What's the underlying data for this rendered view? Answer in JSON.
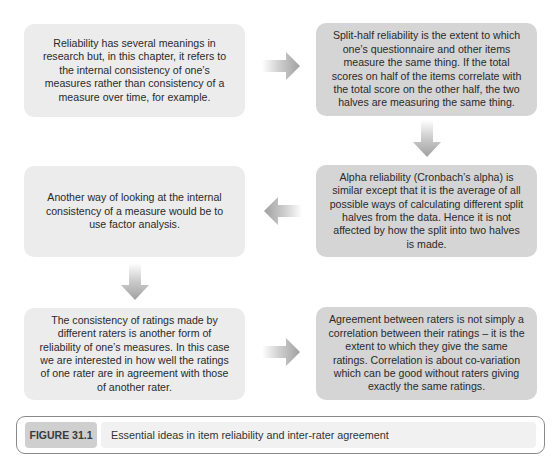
{
  "diagram": {
    "boxes": [
      {
        "id": "b1",
        "text": "Reliability has several meanings in research but, in this chapter, it refers to the internal consistency of one’s measures rather than consistency of a measure over time, for example.",
        "shade": "light"
      },
      {
        "id": "b2",
        "text": "Split-half reliability is the extent to which one’s questionnaire and other items measure the same thing. If the total scores on half of the items correlate with the total score on the other half, the two halves are measuring the same thing.",
        "shade": "dark"
      },
      {
        "id": "b3",
        "text": "Another way of looking at the internal consistency of a measure would be to use factor analysis.",
        "shade": "light"
      },
      {
        "id": "b4",
        "text": "Alpha reliability (Cronbach’s alpha) is similar except that it is the average of all possible ways of calculating different split halves from the data. Hence it is not affected by how the split into two halves is made.",
        "shade": "dark"
      },
      {
        "id": "b5",
        "text": "The consistency of ratings made by different raters is another form of reliability of one’s measures. In this case we are interested in how well the ratings of one rater are in agreement with those of another rater.",
        "shade": "light"
      },
      {
        "id": "b6",
        "text": "Agreement between raters is not simply a correlation between their ratings – it is the extent to which they give the same ratings. Correlation is about co-variation which can be good without raters giving exactly the same ratings.",
        "shade": "dark"
      }
    ],
    "arrows": [
      {
        "from": "b1",
        "to": "b2",
        "direction": "right"
      },
      {
        "from": "b2",
        "to": "b4",
        "direction": "down"
      },
      {
        "from": "b4",
        "to": "b3",
        "direction": "left"
      },
      {
        "from": "b3",
        "to": "b5",
        "direction": "down"
      },
      {
        "from": "b5",
        "to": "b6",
        "direction": "right"
      }
    ],
    "colors": {
      "light_box": "#ececec",
      "dark_box": "#d5d5d5",
      "arrow": "#a8a8a8"
    }
  },
  "caption": {
    "label": "FIGURE 31.1",
    "text": "Essential ideas in item reliability and inter-rater agreement"
  }
}
